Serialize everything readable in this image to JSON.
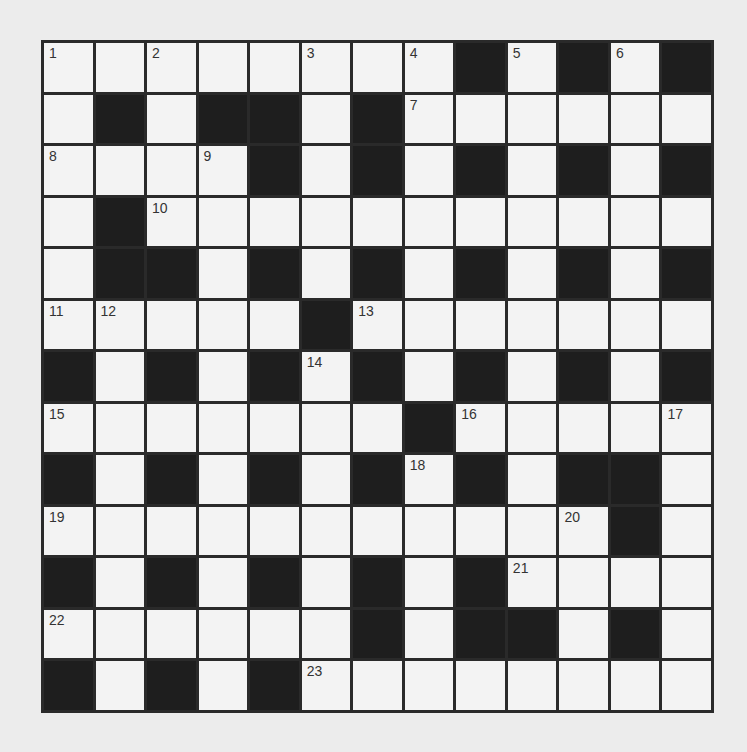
{
  "puzzle": {
    "size": 13,
    "colors": {
      "block": "#1e1e1e",
      "open": "#f3f3f3",
      "border": "#2a2a2a",
      "background": "#ececec"
    },
    "rows": [
      "WWWWWWWWBWBWB",
      "WBWBBWBWWWWWW",
      "WWWWBWBWBWBWB",
      "WBWWWWWWWWWWW",
      "WBBWBWBWBWBWB",
      "WWWWWBWWWWWWW",
      "BWBWBWBWBWBWB",
      "WWWWWWWBWWWWW",
      "BWBWBWBWBWBBW",
      "WWWWWWWWWWWBW",
      "BWBWBWBWBWWWW",
      "WWWWWWBWBBWBW",
      "BWBWBWWWWWWWW"
    ],
    "numbers": [
      {
        "r": 0,
        "c": 0,
        "n": "1"
      },
      {
        "r": 0,
        "c": 2,
        "n": "2"
      },
      {
        "r": 0,
        "c": 5,
        "n": "3"
      },
      {
        "r": 0,
        "c": 7,
        "n": "4"
      },
      {
        "r": 0,
        "c": 9,
        "n": "5"
      },
      {
        "r": 0,
        "c": 11,
        "n": "6"
      },
      {
        "r": 1,
        "c": 7,
        "n": "7"
      },
      {
        "r": 2,
        "c": 0,
        "n": "8"
      },
      {
        "r": 2,
        "c": 3,
        "n": "9"
      },
      {
        "r": 3,
        "c": 2,
        "n": "10"
      },
      {
        "r": 5,
        "c": 0,
        "n": "11"
      },
      {
        "r": 5,
        "c": 1,
        "n": "12"
      },
      {
        "r": 5,
        "c": 6,
        "n": "13"
      },
      {
        "r": 6,
        "c": 5,
        "n": "14"
      },
      {
        "r": 7,
        "c": 0,
        "n": "15"
      },
      {
        "r": 7,
        "c": 8,
        "n": "16"
      },
      {
        "r": 7,
        "c": 12,
        "n": "17"
      },
      {
        "r": 8,
        "c": 7,
        "n": "18"
      },
      {
        "r": 9,
        "c": 0,
        "n": "19"
      },
      {
        "r": 9,
        "c": 10,
        "n": "20"
      },
      {
        "r": 10,
        "c": 9,
        "n": "21"
      },
      {
        "r": 11,
        "c": 0,
        "n": "22"
      },
      {
        "r": 12,
        "c": 5,
        "n": "23"
      }
    ]
  }
}
